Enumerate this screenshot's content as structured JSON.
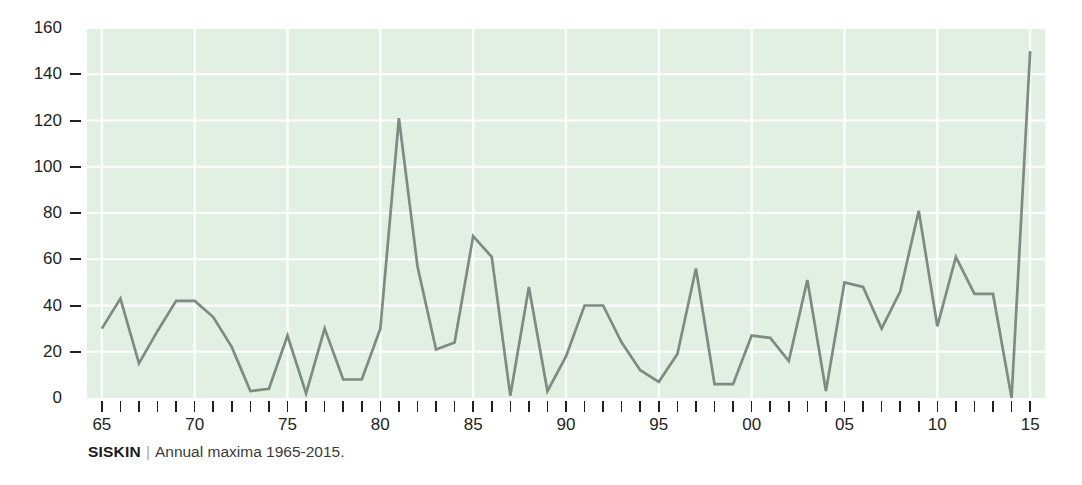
{
  "caption": {
    "species": "SISKIN",
    "separator": "|",
    "text": "Annual maxima 1965-2015."
  },
  "colors": {
    "plot_background": "#e2f0e3",
    "gridline": "#ffffff",
    "series_line": "#7d8b83",
    "axis_text": "#231f20",
    "page_background": "#ffffff"
  },
  "chart_data": {
    "type": "line",
    "title": "",
    "xlabel": "",
    "ylabel": "",
    "xlim": [
      1964.2,
      2015.8
    ],
    "ylim": [
      0,
      160
    ],
    "ytick_values": [
      0,
      20,
      40,
      60,
      80,
      100,
      120,
      140,
      160
    ],
    "ytick_labels": [
      "0",
      "20",
      "40",
      "60",
      "80",
      "100",
      "120",
      "140",
      "160"
    ],
    "xtick_values": [
      1965,
      1966,
      1967,
      1968,
      1969,
      1970,
      1971,
      1972,
      1973,
      1974,
      1975,
      1976,
      1977,
      1978,
      1979,
      1980,
      1981,
      1982,
      1983,
      1984,
      1985,
      1986,
      1987,
      1988,
      1989,
      1990,
      1991,
      1992,
      1993,
      1994,
      1995,
      1996,
      1997,
      1998,
      1999,
      2000,
      2001,
      2002,
      2003,
      2004,
      2005,
      2006,
      2007,
      2008,
      2009,
      2010,
      2011,
      2012,
      2013,
      2014,
      2015
    ],
    "xtick_labeled": [
      {
        "value": 1965,
        "label": "65"
      },
      {
        "value": 1970,
        "label": "70"
      },
      {
        "value": 1975,
        "label": "75"
      },
      {
        "value": 1980,
        "label": "80"
      },
      {
        "value": 1985,
        "label": "85"
      },
      {
        "value": 1990,
        "label": "90"
      },
      {
        "value": 1995,
        "label": "95"
      },
      {
        "value": 2000,
        "label": "00"
      },
      {
        "value": 2005,
        "label": "05"
      },
      {
        "value": 2010,
        "label": "10"
      },
      {
        "value": 2015,
        "label": "15"
      }
    ],
    "grid": true,
    "grid_color": "#ffffff",
    "legend": null,
    "x": [
      1965,
      1966,
      1967,
      1968,
      1969,
      1970,
      1971,
      1972,
      1973,
      1974,
      1975,
      1976,
      1977,
      1978,
      1979,
      1980,
      1981,
      1982,
      1983,
      1984,
      1985,
      1986,
      1987,
      1988,
      1989,
      1990,
      1991,
      1992,
      1993,
      1994,
      1995,
      1996,
      1997,
      1998,
      1999,
      2000,
      2001,
      2002,
      2003,
      2004,
      2005,
      2006,
      2007,
      2008,
      2009,
      2010,
      2011,
      2012,
      2013,
      2014,
      2015
    ],
    "values": [
      30,
      43,
      15,
      29,
      42,
      42,
      35,
      22,
      3,
      4,
      27,
      2,
      30,
      8,
      8,
      30,
      121,
      57,
      21,
      24,
      70,
      61,
      1,
      48,
      3,
      18,
      40,
      40,
      24,
      12,
      7,
      19,
      56,
      6,
      6,
      27,
      26,
      16,
      51,
      3,
      50,
      48,
      30,
      46,
      81,
      31,
      61,
      45,
      45,
      0,
      150
    ],
    "series": [
      {
        "name": "Siskin annual maxima",
        "color": "#7d8b83",
        "values": [
          30,
          43,
          15,
          29,
          42,
          42,
          35,
          22,
          3,
          4,
          27,
          2,
          30,
          8,
          8,
          30,
          121,
          57,
          21,
          24,
          70,
          61,
          1,
          48,
          3,
          18,
          40,
          40,
          24,
          12,
          7,
          19,
          56,
          6,
          6,
          27,
          26,
          16,
          51,
          3,
          50,
          48,
          30,
          46,
          81,
          31,
          61,
          45,
          45,
          0,
          150
        ]
      }
    ]
  }
}
